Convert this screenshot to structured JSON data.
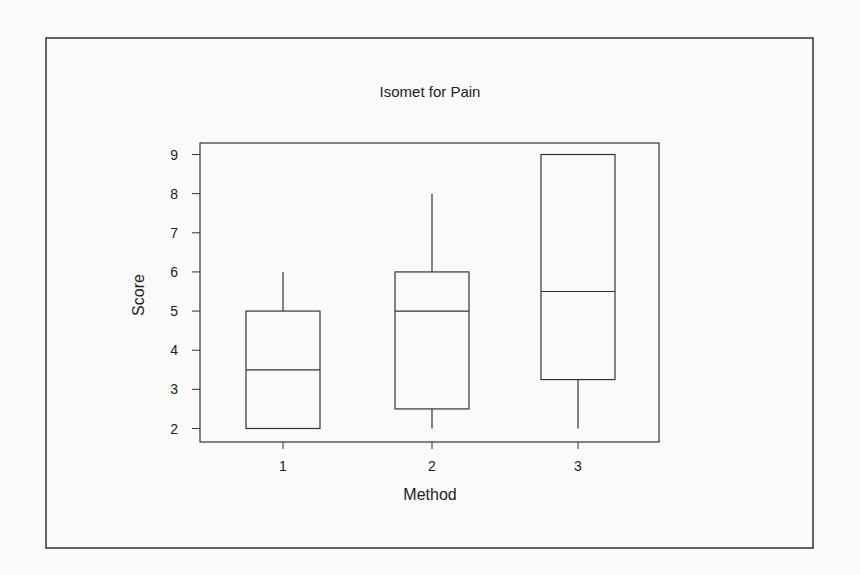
{
  "chart_data": {
    "type": "boxplot",
    "title": "Isomet for Pain",
    "xlabel": "Method",
    "ylabel": "Score",
    "categories": [
      "1",
      "2",
      "3"
    ],
    "ylim": [
      2,
      9
    ],
    "yticks": [
      2,
      3,
      4,
      5,
      6,
      7,
      8,
      9
    ],
    "boxes": [
      {
        "category": "1",
        "whisker_low": 2,
        "q1": 2,
        "median": 3.5,
        "q3": 5,
        "whisker_high": 6
      },
      {
        "category": "2",
        "whisker_low": 2,
        "q1": 2.5,
        "median": 5,
        "q3": 6,
        "whisker_high": 8
      },
      {
        "category": "3",
        "whisker_low": 2,
        "q1": 3.25,
        "median": 5.5,
        "q3": 9,
        "whisker_high": 9
      }
    ],
    "grid": false,
    "legend": "none",
    "colors": {
      "line": "#333333",
      "background": "#fafafa",
      "box_fill": "#ffffff"
    }
  }
}
